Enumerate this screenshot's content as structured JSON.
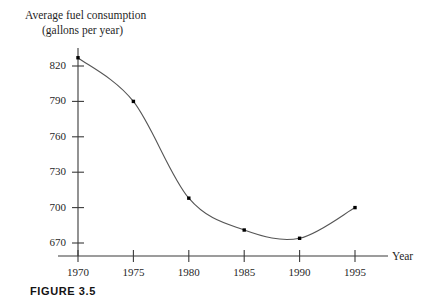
{
  "figure": {
    "caption": "FIGURE 3.5"
  },
  "chart_data": {
    "type": "line",
    "title": "",
    "ylabel_line1": "Average fuel consumption",
    "ylabel_line2": "(gallons per year)",
    "xlabel": "Year",
    "x": [
      1970,
      1975,
      1980,
      1985,
      1990,
      1995
    ],
    "values": [
      827,
      790,
      708,
      681,
      674,
      700
    ],
    "xticks": [
      1970,
      1975,
      1980,
      1985,
      1990,
      1995
    ],
    "xtick_labels": [
      "1970",
      "1975",
      "1980",
      "1985",
      "1990",
      "1995"
    ],
    "yticks": [
      670,
      700,
      730,
      760,
      790,
      820
    ],
    "ytick_labels": [
      "670",
      "700",
      "730",
      "760",
      "790",
      "820"
    ],
    "xlim": [
      1970,
      1995
    ],
    "ylim": [
      661,
      831
    ],
    "grid": false,
    "legend": null,
    "marker": "square-dot",
    "line_color": "#4a4a4a",
    "axis_color": "#2b2b2b",
    "marker_color": "#000000"
  }
}
